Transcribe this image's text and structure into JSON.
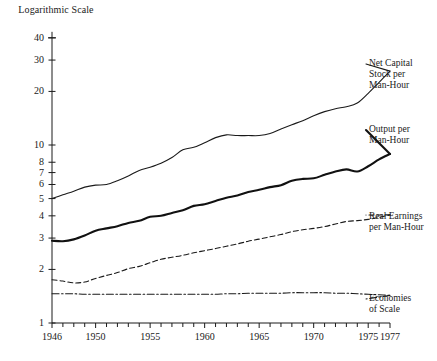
{
  "chart_data": {
    "type": "line",
    "title": "Logarithmic Scale",
    "xlabel": "",
    "ylabel": "Logarithmic Scale",
    "scale": "log",
    "grid": false,
    "legend_position": "right-inline",
    "xlim": [
      1946,
      1977
    ],
    "ylim": [
      1,
      40
    ],
    "x_tick_labels": [
      "1946",
      "1950",
      "1955",
      "1960",
      "1965",
      "1970",
      "1975",
      "1977"
    ],
    "x_tick_values": [
      1946,
      1950,
      1955,
      1960,
      1965,
      1970,
      1975,
      1977
    ],
    "x_minor_ticks_every": 1,
    "y_tick_labels": [
      "1",
      "2",
      "3",
      "4",
      "5",
      "6",
      "7",
      "8",
      "10",
      "20",
      "30",
      "40"
    ],
    "y_tick_values": [
      1,
      2,
      3,
      4,
      5,
      6,
      7,
      8,
      10,
      20,
      30,
      40
    ],
    "x": [
      1946,
      1947,
      1948,
      1949,
      1950,
      1951,
      1952,
      1953,
      1954,
      1955,
      1956,
      1957,
      1958,
      1959,
      1960,
      1961,
      1962,
      1963,
      1964,
      1965,
      1966,
      1967,
      1968,
      1969,
      1970,
      1971,
      1972,
      1973,
      1974,
      1975,
      1976,
      1977
    ],
    "series": [
      {
        "name": "Net Capital Stock per Man-Hour",
        "label": "Net Capital\nStock per\nMan-Hour",
        "style": "solid",
        "line_width": 1.1,
        "color": "#1a1a1a",
        "values": [
          5.0,
          5.25,
          5.5,
          5.8,
          5.95,
          6.0,
          6.3,
          6.7,
          7.2,
          7.5,
          7.9,
          8.5,
          9.4,
          9.7,
          10.3,
          11.0,
          11.4,
          11.3,
          11.3,
          11.3,
          11.6,
          12.3,
          13.0,
          13.7,
          14.6,
          15.4,
          16.0,
          16.4,
          17.2,
          19.5,
          22.5,
          26.0
        ]
      },
      {
        "name": "Output per Man-Hour",
        "label": "Output per\nMan-Hour",
        "style": "solid",
        "line_width": 2.1,
        "color": "#111111",
        "values": [
          2.9,
          2.88,
          2.95,
          3.1,
          3.3,
          3.4,
          3.5,
          3.65,
          3.75,
          3.95,
          4.0,
          4.15,
          4.3,
          4.55,
          4.65,
          4.85,
          5.05,
          5.2,
          5.45,
          5.6,
          5.8,
          5.95,
          6.3,
          6.45,
          6.5,
          6.8,
          7.1,
          7.3,
          7.1,
          7.6,
          8.3,
          8.9
        ]
      },
      {
        "name": "Real Earnings per Man-Hour",
        "label": "Real Earnings\nper Man-Hour",
        "style": "dashed",
        "line_width": 1.1,
        "color": "#1a1a1a",
        "values": [
          1.75,
          1.72,
          1.68,
          1.7,
          1.78,
          1.85,
          1.92,
          2.02,
          2.08,
          2.18,
          2.28,
          2.34,
          2.4,
          2.48,
          2.55,
          2.62,
          2.7,
          2.78,
          2.88,
          2.96,
          3.05,
          3.14,
          3.26,
          3.34,
          3.4,
          3.48,
          3.6,
          3.72,
          3.76,
          3.82,
          3.92,
          4.05
        ]
      },
      {
        "name": "Economies of Scale",
        "label": "Economies\nof Scale",
        "style": "dashdot",
        "line_width": 1.1,
        "color": "#1a1a1a",
        "values": [
          1.46,
          1.46,
          1.46,
          1.45,
          1.45,
          1.45,
          1.45,
          1.45,
          1.45,
          1.45,
          1.45,
          1.45,
          1.45,
          1.45,
          1.45,
          1.45,
          1.46,
          1.46,
          1.47,
          1.47,
          1.47,
          1.47,
          1.48,
          1.48,
          1.48,
          1.48,
          1.47,
          1.47,
          1.46,
          1.45,
          1.44,
          1.43
        ]
      }
    ]
  },
  "labels": {
    "axis_title": "Logarithmic\nScale",
    "series_1": "Net Capital\nStock per\nMan-Hour",
    "series_2": "Output per\nMan-Hour",
    "series_3": "Real Earnings\nper Man-Hour",
    "series_4": "Economies\nof Scale"
  }
}
